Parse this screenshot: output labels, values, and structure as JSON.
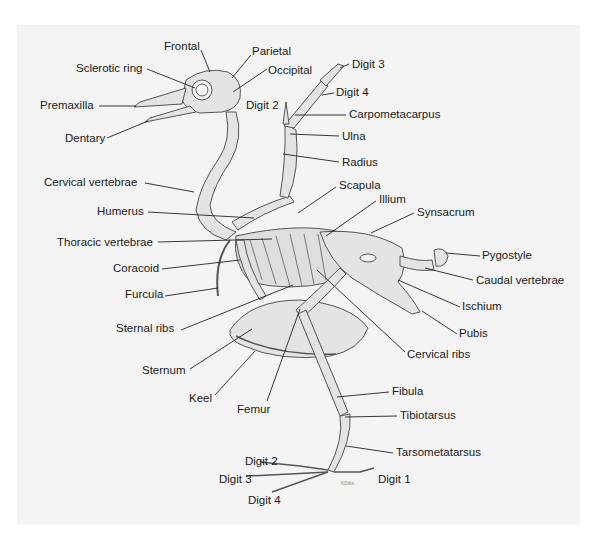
{
  "diagram": {
    "background_color": "#f4f4f4",
    "bone_fill": "#e4e4e4",
    "bone_stroke": "#555555",
    "signature": "KDibs",
    "labels": [
      {
        "id": "frontal",
        "text": "Frontal",
        "x": 164,
        "y": 40,
        "lx1": 201,
        "ly1": 50,
        "lx2": 210,
        "ly2": 72
      },
      {
        "id": "parietal",
        "text": "Parietal",
        "x": 252,
        "y": 45,
        "lx1": 251,
        "ly1": 55,
        "lx2": 232,
        "ly2": 78
      },
      {
        "id": "sclerotic-ring",
        "text": "Sclerotic ring",
        "x": 76,
        "y": 62,
        "lx1": 147,
        "ly1": 69,
        "lx2": 195,
        "ly2": 88
      },
      {
        "id": "occipital",
        "text": "Occipital",
        "x": 268,
        "y": 64,
        "lx1": 267,
        "ly1": 69,
        "lx2": 233,
        "ly2": 92
      },
      {
        "id": "digit-3-wing",
        "text": "Digit 3",
        "x": 352,
        "y": 58,
        "lx1": 349,
        "ly1": 64,
        "lx2": 340,
        "ly2": 68
      },
      {
        "id": "premaxilla",
        "text": "Premaxilla",
        "x": 40,
        "y": 99,
        "lx1": 99,
        "ly1": 106,
        "lx2": 136,
        "ly2": 106
      },
      {
        "id": "digit-2-wing",
        "text": "Digit 2",
        "x": 246,
        "y": 99,
        "lx1": 0,
        "ly1": 0,
        "lx2": 0,
        "ly2": 0
      },
      {
        "id": "digit-4-wing",
        "text": "Digit 4",
        "x": 336,
        "y": 86,
        "lx1": 334,
        "ly1": 93,
        "lx2": 322,
        "ly2": 95
      },
      {
        "id": "carpometacarpus",
        "text": "Carpometacarpus",
        "x": 349,
        "y": 108,
        "lx1": 346,
        "ly1": 115,
        "lx2": 295,
        "ly2": 115
      },
      {
        "id": "dentary",
        "text": "Dentary",
        "x": 65,
        "y": 132,
        "lx1": 107,
        "ly1": 138,
        "lx2": 148,
        "ly2": 121
      },
      {
        "id": "ulna",
        "text": "Ulna",
        "x": 342,
        "y": 130,
        "lx1": 339,
        "ly1": 136,
        "lx2": 290,
        "ly2": 134
      },
      {
        "id": "radius",
        "text": "Radius",
        "x": 342,
        "y": 156,
        "lx1": 339,
        "ly1": 162,
        "lx2": 283,
        "ly2": 154
      },
      {
        "id": "cervical-vertebrae",
        "text": "Cervical vertebrae",
        "x": 44,
        "y": 176,
        "lx1": 145,
        "ly1": 183,
        "lx2": 194,
        "ly2": 192
      },
      {
        "id": "scapula",
        "text": "Scapula",
        "x": 339,
        "y": 179,
        "lx1": 336,
        "ly1": 187,
        "lx2": 298,
        "ly2": 213
      },
      {
        "id": "illium",
        "text": "Illium",
        "x": 379,
        "y": 193,
        "lx1": 376,
        "ly1": 201,
        "lx2": 326,
        "ly2": 236
      },
      {
        "id": "humerus",
        "text": "Humerus",
        "x": 97,
        "y": 205,
        "lx1": 148,
        "ly1": 212,
        "lx2": 254,
        "ly2": 218
      },
      {
        "id": "synsacrum",
        "text": "Synsacrum",
        "x": 417,
        "y": 206,
        "lx1": 414,
        "ly1": 213,
        "lx2": 371,
        "ly2": 233
      },
      {
        "id": "thoracic-vertebrae",
        "text": "Thoracic vertebrae",
        "x": 57,
        "y": 236,
        "lx1": 158,
        "ly1": 242,
        "lx2": 272,
        "ly2": 239
      },
      {
        "id": "pygostyle",
        "text": "Pygostyle",
        "x": 482,
        "y": 249,
        "lx1": 480,
        "ly1": 256,
        "lx2": 446,
        "ly2": 253
      },
      {
        "id": "coracoid",
        "text": "Coracoid",
        "x": 113,
        "y": 262,
        "lx1": 162,
        "ly1": 269,
        "lx2": 240,
        "ly2": 260
      },
      {
        "id": "caudal-vertebrae",
        "text": "Caudal vertebrae",
        "x": 476,
        "y": 274,
        "lx1": 473,
        "ly1": 280,
        "lx2": 425,
        "ly2": 268
      },
      {
        "id": "furcula",
        "text": "Furcula",
        "x": 125,
        "y": 288,
        "lx1": 165,
        "ly1": 296,
        "lx2": 218,
        "ly2": 288
      },
      {
        "id": "ischium",
        "text": "Ischium",
        "x": 462,
        "y": 300,
        "lx1": 460,
        "ly1": 307,
        "lx2": 398,
        "ly2": 280
      },
      {
        "id": "sternal-ribs",
        "text": "Sternal ribs",
        "x": 116,
        "y": 322,
        "lx1": 181,
        "ly1": 330,
        "lx2": 293,
        "ly2": 285
      },
      {
        "id": "pubis",
        "text": "Pubis",
        "x": 459,
        "y": 327,
        "lx1": 457,
        "ly1": 334,
        "lx2": 422,
        "ly2": 311
      },
      {
        "id": "cervical-ribs",
        "text": "Cervical ribs",
        "x": 407,
        "y": 348,
        "lx1": 405,
        "ly1": 352,
        "lx2": 317,
        "ly2": 270
      },
      {
        "id": "sternum",
        "text": "Sternum",
        "x": 142,
        "y": 364,
        "lx1": 190,
        "ly1": 369,
        "lx2": 252,
        "ly2": 329
      },
      {
        "id": "keel",
        "text": "Keel",
        "x": 189,
        "y": 392,
        "lx1": 215,
        "ly1": 395,
        "lx2": 255,
        "ly2": 351
      },
      {
        "id": "femur",
        "text": "Femur",
        "x": 237,
        "y": 403,
        "lx1": 267,
        "ly1": 401,
        "lx2": 300,
        "ly2": 309
      },
      {
        "id": "fibula",
        "text": "Fibula",
        "x": 392,
        "y": 385,
        "lx1": 389,
        "ly1": 392,
        "lx2": 337,
        "ly2": 397
      },
      {
        "id": "tibiotarsus",
        "text": "Tibiotarsus",
        "x": 400,
        "y": 409,
        "lx1": 397,
        "ly1": 416,
        "lx2": 345,
        "ly2": 417
      },
      {
        "id": "tarsometatarsus",
        "text": "Tarsometatarsus",
        "x": 396,
        "y": 446,
        "lx1": 393,
        "ly1": 453,
        "lx2": 346,
        "ly2": 446
      },
      {
        "id": "digit-2-foot",
        "text": "Digit 2",
        "x": 245,
        "y": 455,
        "lx1": 0,
        "ly1": 0,
        "lx2": 0,
        "ly2": 0
      },
      {
        "id": "digit-3-foot",
        "text": "Digit 3",
        "x": 219,
        "y": 473,
        "lx1": 0,
        "ly1": 0,
        "lx2": 0,
        "ly2": 0
      },
      {
        "id": "digit-1-foot",
        "text": "Digit 1",
        "x": 378,
        "y": 473,
        "lx1": 0,
        "ly1": 0,
        "lx2": 0,
        "ly2": 0
      },
      {
        "id": "digit-4-foot",
        "text": "Digit 4",
        "x": 248,
        "y": 494,
        "lx1": 0,
        "ly1": 0,
        "lx2": 0,
        "ly2": 0
      }
    ]
  }
}
